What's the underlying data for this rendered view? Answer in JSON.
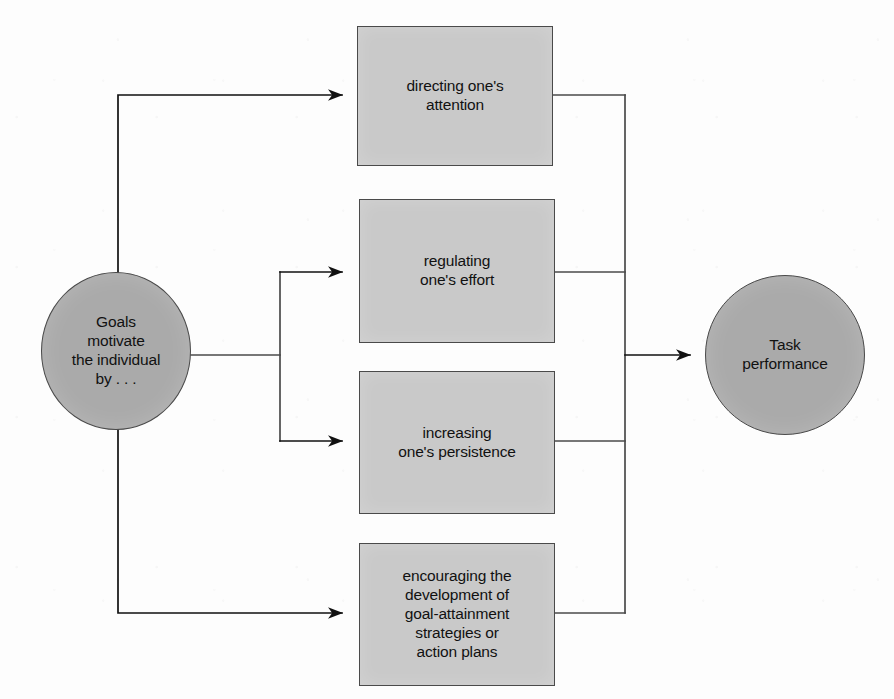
{
  "diagram": {
    "colors": {
      "circle_fill": "#aaaaaa",
      "box_fill": "#c9c9c9",
      "stroke": "#4a4a4a",
      "text": "#111111",
      "background": "#fdfdfd"
    },
    "source_node": {
      "id": "goals",
      "shape": "ellipse",
      "label": "Goals\nmotivate\nthe individual\nby . . ."
    },
    "mediator_nodes": [
      {
        "id": "attention",
        "shape": "rectangle",
        "label": "directing one's\nattention"
      },
      {
        "id": "effort",
        "shape": "rectangle",
        "label": "regulating\none's effort"
      },
      {
        "id": "persistence",
        "shape": "rectangle",
        "label": "increasing\none's persistence"
      },
      {
        "id": "strategies",
        "shape": "rectangle",
        "label": "encouraging the\ndevelopment of\ngoal-attainment\nstrategies or\naction plans"
      }
    ],
    "outcome_node": {
      "id": "task-performance",
      "shape": "ellipse",
      "label": "Task\nperformance"
    },
    "edges": [
      {
        "from": "goals",
        "to": "attention",
        "arrow": true
      },
      {
        "from": "goals",
        "to": "effort",
        "arrow": true
      },
      {
        "from": "goals",
        "to": "persistence",
        "arrow": true
      },
      {
        "from": "goals",
        "to": "strategies",
        "arrow": true
      },
      {
        "from": "attention",
        "to": "task-performance",
        "arrow": false
      },
      {
        "from": "effort",
        "to": "task-performance",
        "arrow": false
      },
      {
        "from": "persistence",
        "to": "task-performance",
        "arrow": false
      },
      {
        "from": "strategies",
        "to": "task-performance",
        "arrow": false
      },
      {
        "from": "collector",
        "to": "task-performance",
        "arrow": true
      }
    ]
  }
}
